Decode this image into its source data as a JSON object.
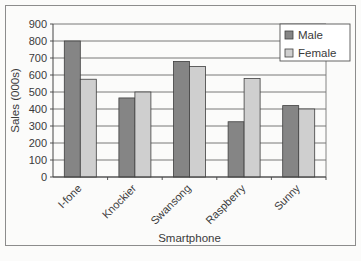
{
  "chart_data": {
    "type": "bar",
    "title": "",
    "xlabel": "Smartphone",
    "ylabel": "Sales (000s)",
    "ylim": [
      0,
      900
    ],
    "yticks": [
      0,
      100,
      200,
      300,
      400,
      500,
      600,
      700,
      800,
      900
    ],
    "grid": true,
    "legend_position": "top-right-inside",
    "categories": [
      "I-fone",
      "Knockier",
      "Swansong",
      "Raspberry",
      "Sunny"
    ],
    "series": [
      {
        "name": "Male",
        "color": "#858585",
        "values": [
          800,
          465,
          680,
          325,
          420
        ]
      },
      {
        "name": "Female",
        "color": "#cfcfcf",
        "values": [
          575,
          500,
          650,
          580,
          400
        ]
      }
    ]
  }
}
